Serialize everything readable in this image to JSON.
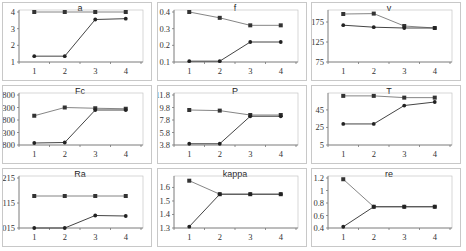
{
  "chart_data": [
    {
      "id": "a",
      "type": "line",
      "title": "a",
      "xlabel": "",
      "ylabel": "",
      "categories": [
        1,
        2,
        3,
        4
      ],
      "yticks": [
        1,
        2,
        3,
        4
      ],
      "ylim": [
        1,
        4
      ],
      "series": [
        {
          "name": "series1",
          "marker": "square",
          "values": [
            4.0,
            4.0,
            4.0,
            4.0
          ]
        },
        {
          "name": "series2",
          "marker": "diamond",
          "values": [
            1.35,
            1.35,
            3.55,
            3.6
          ]
        }
      ],
      "grid": false,
      "legend": "none"
    },
    {
      "id": "f",
      "type": "line",
      "title": "f",
      "xlabel": "",
      "ylabel": "",
      "categories": [
        1,
        2,
        3,
        4
      ],
      "yticks": [
        0.1,
        0.2,
        0.3,
        0.4
      ],
      "ylim": [
        0.1,
        0.4
      ],
      "series": [
        {
          "name": "series1",
          "marker": "square",
          "values": [
            0.4,
            0.365,
            0.32,
            0.32
          ]
        },
        {
          "name": "series2",
          "marker": "diamond",
          "values": [
            0.105,
            0.105,
            0.22,
            0.22
          ]
        }
      ],
      "grid": false,
      "legend": "none"
    },
    {
      "id": "v",
      "type": "line",
      "title": "v",
      "xlabel": "",
      "ylabel": "",
      "categories": [
        1,
        2,
        3,
        4
      ],
      "yticks": [
        75,
        125,
        175
      ],
      "ylim": [
        75,
        200
      ],
      "series": [
        {
          "name": "series1",
          "marker": "square",
          "values": [
            195,
            196,
            165,
            160
          ]
        },
        {
          "name": "series2",
          "marker": "diamond",
          "values": [
            167,
            162,
            160,
            160
          ]
        }
      ],
      "grid": false,
      "legend": "none"
    },
    {
      "id": "Fc",
      "type": "line",
      "title": "Fc",
      "xlabel": "",
      "ylabel": "",
      "categories": [
        1,
        2,
        3,
        4
      ],
      "yticks": [
        800,
        1300,
        1800,
        2300,
        2800
      ],
      "ylim": [
        800,
        2800
      ],
      "series": [
        {
          "name": "series1",
          "marker": "square",
          "values": [
            1970,
            2300,
            2270,
            2250
          ]
        },
        {
          "name": "series2",
          "marker": "diamond",
          "values": [
            880,
            900,
            2200,
            2200
          ]
        }
      ],
      "grid": false,
      "legend": "none"
    },
    {
      "id": "P",
      "type": "line",
      "title": "P",
      "xlabel": "",
      "ylabel": "",
      "categories": [
        1,
        2,
        3,
        4
      ],
      "yticks": [
        3.8,
        5.8,
        7.8,
        9.8,
        11.8
      ],
      "ylim": [
        3.8,
        11.8
      ],
      "series": [
        {
          "name": "series1",
          "marker": "square",
          "values": [
            9.4,
            9.3,
            8.6,
            8.6
          ]
        },
        {
          "name": "series2",
          "marker": "diamond",
          "values": [
            4.0,
            4.0,
            8.4,
            8.4
          ]
        }
      ],
      "grid": false,
      "legend": "none"
    },
    {
      "id": "T",
      "type": "line",
      "title": "T",
      "xlabel": "",
      "ylabel": "",
      "categories": [
        1,
        2,
        3,
        4
      ],
      "yticks": [
        5,
        25,
        45
      ],
      "ylim": [
        5,
        62
      ],
      "series": [
        {
          "name": "series1",
          "marker": "square",
          "values": [
            61,
            61,
            59,
            59
          ]
        },
        {
          "name": "series2",
          "marker": "diamond",
          "values": [
            29,
            29,
            50,
            54
          ]
        }
      ],
      "grid": false,
      "legend": "none"
    },
    {
      "id": "Ra",
      "type": "line",
      "title": "Ra",
      "xlabel": "",
      "ylabel": "",
      "categories": [
        1,
        2,
        3,
        4
      ],
      "yticks": [
        0.0015,
        0.0115,
        0.0215
      ],
      "ylim": [
        0.0015,
        0.0215
      ],
      "series": [
        {
          "name": "series1",
          "marker": "square",
          "values": [
            0.0143,
            0.0143,
            0.0143,
            0.0143
          ]
        },
        {
          "name": "series2",
          "marker": "diamond",
          "values": [
            0.0015,
            0.0015,
            0.0065,
            0.0063
          ]
        }
      ],
      "grid": false,
      "legend": "none"
    },
    {
      "id": "kappa",
      "type": "line",
      "title": "kappa",
      "xlabel": "",
      "ylabel": "",
      "categories": [
        1,
        2,
        3,
        4
      ],
      "yticks": [
        1.3,
        1.4,
        1.5,
        1.6
      ],
      "ylim": [
        1.3,
        1.67
      ],
      "series": [
        {
          "name": "series1",
          "marker": "square",
          "values": [
            1.65,
            1.55,
            1.55,
            1.55
          ]
        },
        {
          "name": "series2",
          "marker": "diamond",
          "values": [
            1.31,
            1.55,
            1.55,
            1.55
          ]
        }
      ],
      "grid": false,
      "legend": "none"
    },
    {
      "id": "re",
      "type": "line",
      "title": "re",
      "xlabel": "",
      "ylabel": "",
      "categories": [
        1,
        2,
        3,
        4
      ],
      "yticks": [
        0.4,
        0.6,
        0.8,
        1,
        1.2
      ],
      "ylim": [
        0.4,
        1.2
      ],
      "series": [
        {
          "name": "series1",
          "marker": "square",
          "values": [
            1.18,
            0.74,
            0.74,
            0.74
          ]
        },
        {
          "name": "series2",
          "marker": "diamond",
          "values": [
            0.42,
            0.74,
            0.74,
            0.74
          ]
        }
      ],
      "grid": false,
      "legend": "none"
    }
  ],
  "layout": {
    "rows": 3,
    "cols": 3
  }
}
